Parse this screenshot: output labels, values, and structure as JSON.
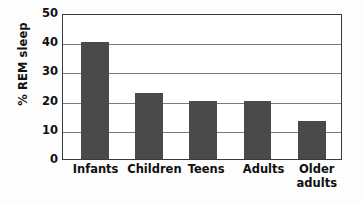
{
  "chart_data": {
    "type": "bar",
    "title": "",
    "subtitle": "",
    "xlabel": "",
    "ylabel": "% REM sleep",
    "categories": [
      "Infants",
      "Children",
      "Teens",
      "Adults",
      "Older\nadults"
    ],
    "values": [
      40,
      22.5,
      20,
      20,
      13
    ],
    "ylim": [
      0,
      50
    ],
    "yticks": [
      0,
      10,
      20,
      30,
      40,
      50
    ],
    "ytick_labels": [
      "0",
      "10",
      "20",
      "30",
      "40",
      "50"
    ],
    "grid": true,
    "grid_axis": "y",
    "legend": false,
    "legend_position": "none",
    "bar_color": "#4a4a4a",
    "axis_color": "#3b3b3b",
    "gridline_color": "#7c7c7c",
    "background_color": "#ffffff",
    "annotations": []
  },
  "geometry": {
    "bar_slots": [
      {
        "label": "Infants",
        "center_pct": 11.5,
        "width_pct": 10.0
      },
      {
        "label": "Children",
        "center_pct": 31.0,
        "width_pct": 10.0
      },
      {
        "label": "Teens",
        "center_pct": 50.5,
        "width_pct": 10.0
      },
      {
        "label": "Adults",
        "center_pct": 70.0,
        "width_pct": 10.0
      },
      {
        "label": "Older adults",
        "center_pct": 89.5,
        "width_pct": 10.0
      }
    ],
    "label_centers_pct": [
      12.0,
      33.0,
      51.5,
      72.0,
      91.0
    ]
  }
}
